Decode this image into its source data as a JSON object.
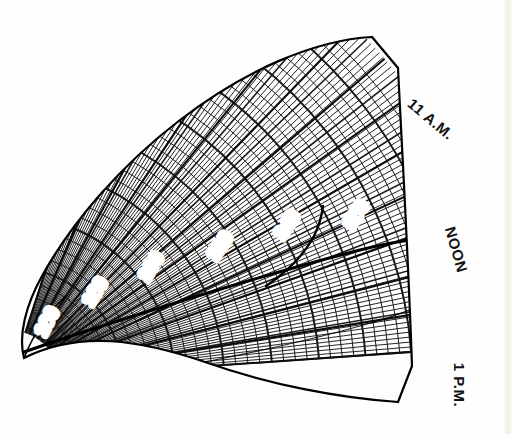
{
  "figure": {
    "kind": "sundial-hour-chart",
    "title": "",
    "background_color": "#ffffff",
    "ink_color": "#111111"
  },
  "chart_data": {
    "type": "line",
    "title": "",
    "subtitle": "",
    "xlabel": "",
    "ylabel": "",
    "grid": true,
    "legend_position": "none",
    "projection": "polar-sector",
    "sector": {
      "center_x": 10,
      "center_y": 380,
      "inner_radius": 55,
      "outer_radius": 470,
      "start_angle_deg": -72,
      "end_angle_deg": -4
    },
    "hour_labels": [
      {
        "text": "11 A.M.",
        "angle_deg": -62,
        "rotation_deg": 40,
        "x": 430,
        "y": 120
      },
      {
        "text": "NOON",
        "angle_deg": -34,
        "rotation_deg": 74,
        "x": 455,
        "y": 250
      },
      {
        "text": "1 P.M.",
        "angle_deg": -10,
        "rotation_deg": 90,
        "x": 458,
        "y": 385
      }
    ],
    "contour_labels": [
      {
        "text": "160",
        "x": 48,
        "y": 322,
        "rotation_deg": -62
      },
      {
        "text": "180",
        "x": 96,
        "y": 292,
        "rotation_deg": -58
      },
      {
        "text": "200",
        "x": 152,
        "y": 267,
        "rotation_deg": -57
      },
      {
        "text": "220",
        "x": 221,
        "y": 246,
        "rotation_deg": -56
      },
      {
        "text": "240",
        "x": 288,
        "y": 225,
        "rotation_deg": -56
      },
      {
        "text": "260",
        "x": 357,
        "y": 215,
        "rotation_deg": -56
      }
    ],
    "contour_values": [
      160,
      180,
      200,
      220,
      240,
      260
    ],
    "contour_units": "",
    "major_arc_count": 8,
    "minor_radial_count": 96,
    "major_radial_count": 13,
    "heavy_curve_present": true
  }
}
